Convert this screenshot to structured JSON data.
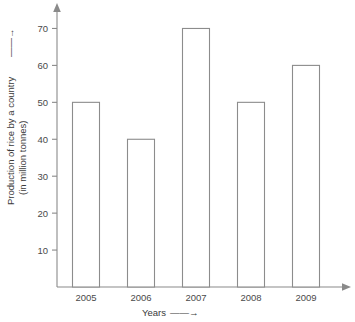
{
  "chart_data": {
    "type": "bar",
    "title": "",
    "categories": [
      "2005",
      "2006",
      "2007",
      "2008",
      "2009"
    ],
    "values": [
      50,
      40,
      70,
      50,
      60
    ],
    "xlabel": "Years",
    "ylabel": "Production of rice by a country",
    "ylabel_line2": "(in million tonnes)",
    "ylim": [
      0,
      75
    ],
    "yticks": [
      10,
      20,
      30,
      40,
      50,
      60,
      70
    ],
    "ytick_labels": [
      "10",
      "20",
      "30",
      "40",
      "50",
      "60",
      "70"
    ],
    "grid": false,
    "legend": "none",
    "bar_fill": "#ffffff",
    "bar_stroke": "#8c8c8c",
    "axis_color": "#8a8a8a",
    "xlabel_arrow": "⟶",
    "ylabel_arrow": "⟶"
  },
  "labels": {
    "y_axis_title_line1": "Production of rice by a country",
    "y_axis_title_arrow": "——→",
    "y_axis_title_line2": "(in million tonnes)",
    "x_axis_title": "Years",
    "x_axis_title_arrow": "——→"
  }
}
